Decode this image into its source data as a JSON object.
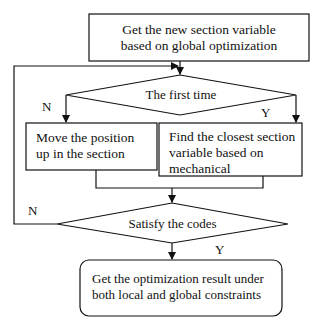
{
  "diagram": {
    "type": "flowchart",
    "nodes": {
      "start": {
        "shape": "rectangle",
        "lines": [
          "Get the new section variable",
          "based on global optimization"
        ]
      },
      "decision1": {
        "shape": "diamond",
        "label": "The first time"
      },
      "left_box": {
        "shape": "rectangle",
        "lines": [
          "Move the position",
          "up in the section"
        ]
      },
      "right_box": {
        "shape": "rectangle",
        "lines": [
          "Find the closest section",
          "variable based on",
          "mechanical"
        ]
      },
      "decision2": {
        "shape": "diamond",
        "label": "Satisfy the codes"
      },
      "end": {
        "shape": "rounded-rectangle",
        "lines": [
          "Get the optimization result under",
          "both local and global constraints"
        ]
      }
    },
    "edge_labels": {
      "decision1_no": "N",
      "decision1_yes": "Y",
      "decision2_no": "N",
      "decision2_yes": "Y"
    },
    "edges": [
      {
        "from": "start",
        "to": "decision1"
      },
      {
        "from": "decision1",
        "to": "left_box",
        "label": "N"
      },
      {
        "from": "decision1",
        "to": "right_box",
        "label": "Y"
      },
      {
        "from": "left_box",
        "to": "decision2"
      },
      {
        "from": "right_box",
        "to": "decision2"
      },
      {
        "from": "decision2",
        "to": "decision1",
        "label": "N"
      },
      {
        "from": "decision2",
        "to": "end",
        "label": "Y"
      }
    ]
  }
}
